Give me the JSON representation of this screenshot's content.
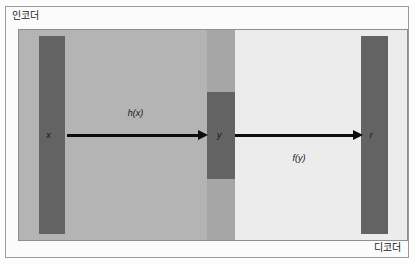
{
  "figure": {
    "type": "autoencoder-block-diagram",
    "encoder_caption": "인코더",
    "decoder_caption": "디코더",
    "colors": {
      "encoder_region": "#b4b4b4",
      "center_region": "#a6a6a6",
      "decoder_region": "#ececec",
      "bar": "#636363",
      "arrow": "#0d0d0d",
      "frame_border": "#8e8e8e",
      "page_background": "#fdfdfd"
    }
  },
  "nodes": [
    {
      "id": "x",
      "label": "x",
      "role": "input-vector"
    },
    {
      "id": "y",
      "label": "y",
      "role": "latent-code"
    },
    {
      "id": "r",
      "label": "r",
      "role": "reconstruction"
    }
  ],
  "edges": [
    {
      "id": "hx",
      "label": "h(x)",
      "from": "x",
      "to": "y",
      "role": "encoder-function",
      "label_position": "above"
    },
    {
      "id": "fy",
      "label": "f(y)",
      "from": "y",
      "to": "r",
      "role": "decoder-function",
      "label_position": "below"
    }
  ]
}
